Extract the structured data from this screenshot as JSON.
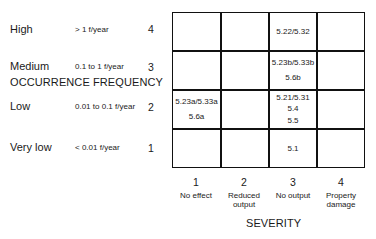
{
  "y_axis": {
    "title": "OCCURRENCE FREQUENCY",
    "levels": [
      {
        "name": "High",
        "rate": "> 1 f/year",
        "num": "4"
      },
      {
        "name": "Medium",
        "rate": "0.1 to 1 f/year",
        "num": "3"
      },
      {
        "name": "Low",
        "rate": "0.01 to 0.1 f/year",
        "num": "2"
      },
      {
        "name": "Very low",
        "rate": "< 0.01 f/year",
        "num": "1"
      }
    ]
  },
  "x_axis": {
    "title": "SEVERITY",
    "levels": [
      {
        "num": "1",
        "label": "No effect"
      },
      {
        "num": "2",
        "label": "Reduced output"
      },
      {
        "num": "3",
        "label": "No output"
      },
      {
        "num": "4",
        "label": "Property damage"
      }
    ]
  },
  "matrix": {
    "rows": [
      {
        "freq": "4",
        "cells": [
          [],
          [],
          [
            "5.22/5.32"
          ],
          []
        ]
      },
      {
        "freq": "3",
        "cells": [
          [],
          [],
          [
            "5.23b/5.33b",
            "5.6b"
          ],
          []
        ]
      },
      {
        "freq": "2",
        "cells": [
          [
            "5.23a/5.33a",
            "5.6a"
          ],
          [],
          [
            "5.21/5.31",
            "5.4",
            "5.5"
          ],
          []
        ]
      },
      {
        "freq": "1",
        "cells": [
          [],
          [],
          [
            "5.1"
          ],
          []
        ]
      }
    ]
  }
}
